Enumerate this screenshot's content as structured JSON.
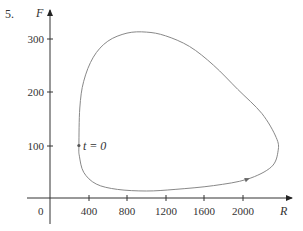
{
  "problem_number": "5.",
  "chart_data": {
    "type": "line",
    "title": "",
    "xlabel": "R",
    "ylabel": "F",
    "origin_label": "0",
    "x_ticks": [
      400,
      800,
      1200,
      1600,
      2000
    ],
    "y_ticks": [
      100,
      200,
      300
    ],
    "xlim": [
      0,
      2500
    ],
    "ylim": [
      0,
      330
    ],
    "grid": false,
    "series": [
      {
        "name": "phase trajectory",
        "closed": true,
        "direction": "counterclockwise",
        "points": [
          [
            300,
            100
          ],
          [
            310,
            170
          ],
          [
            350,
            220
          ],
          [
            450,
            265
          ],
          [
            600,
            295
          ],
          [
            800,
            310
          ],
          [
            1000,
            312
          ],
          [
            1200,
            305
          ],
          [
            1450,
            285
          ],
          [
            1700,
            250
          ],
          [
            1950,
            205
          ],
          [
            2200,
            160
          ],
          [
            2350,
            115
          ],
          [
            2370,
            90
          ],
          [
            2300,
            60
          ],
          [
            2050,
            37
          ],
          [
            1700,
            25
          ],
          [
            1300,
            18
          ],
          [
            1000,
            15
          ],
          [
            700,
            18
          ],
          [
            480,
            28
          ],
          [
            350,
            50
          ],
          [
            305,
            80
          ],
          [
            300,
            100
          ]
        ]
      }
    ],
    "annotations": [
      {
        "text": "t = 0",
        "x": 300,
        "y": 100
      }
    ],
    "direction_arrow": {
      "x": 2050,
      "y": 37
    }
  },
  "labels": {
    "x_axis": "R",
    "y_axis": "F",
    "origin": "0",
    "t0": "t = 0",
    "x_ticks": [
      "400",
      "800",
      "1200",
      "1600",
      "2000"
    ],
    "y_ticks": [
      "100",
      "200",
      "300"
    ]
  }
}
